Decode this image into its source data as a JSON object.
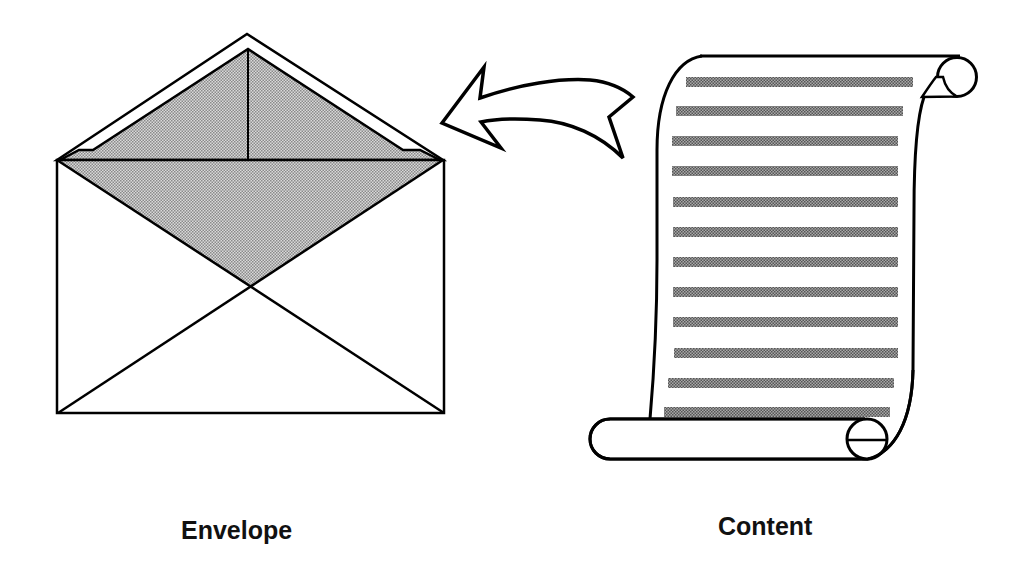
{
  "diagram": {
    "labels": {
      "envelope": "Envelope",
      "content": "Content"
    },
    "elements": [
      {
        "id": "envelope",
        "shape": "open-envelope",
        "label": "Envelope"
      },
      {
        "id": "content",
        "shape": "scroll-with-text-lines",
        "label": "Content",
        "text_line_count": 12
      },
      {
        "id": "arrow",
        "shape": "curved-arrow",
        "from": "content",
        "to": "envelope"
      }
    ],
    "colors": {
      "stroke": "#000000",
      "fill_shaded": "#b8b8b8",
      "text_line": "#7a7a7a",
      "background": "#ffffff",
      "label_text": "#111111"
    }
  }
}
